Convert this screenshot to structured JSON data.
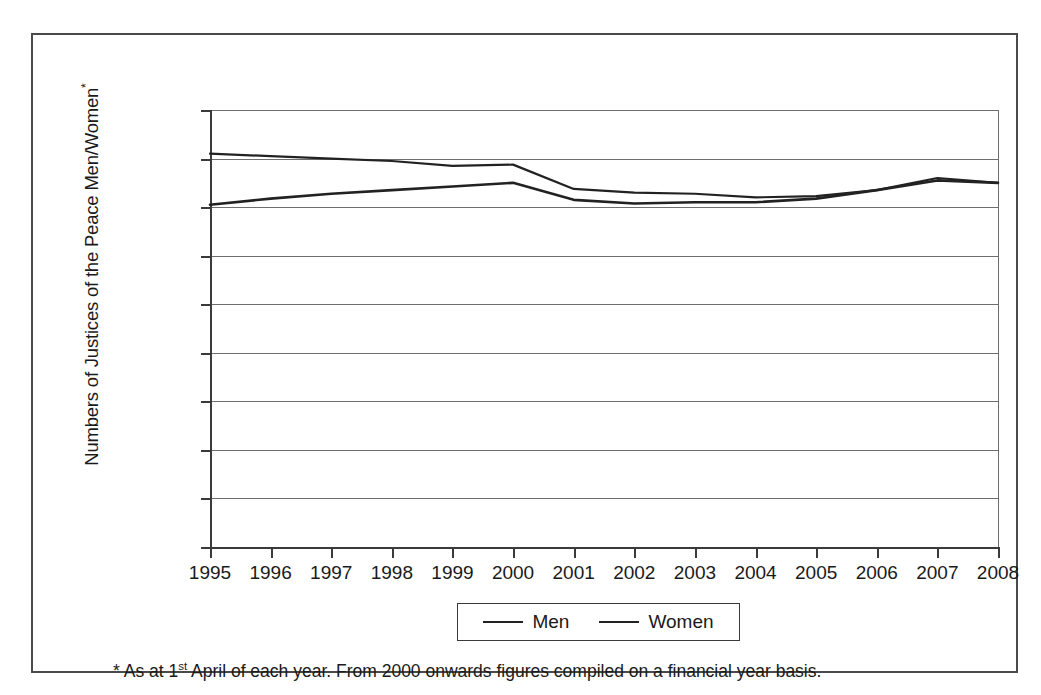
{
  "chart_data": {
    "type": "line",
    "title": "",
    "xlabel": "",
    "ylabel": "Numbers of Justices of the Peace Men/Women*",
    "ylabel_base": "Numbers of Justices of the Peace Men/Women",
    "ylabel_sup": "*",
    "x": [
      1995,
      1996,
      1997,
      1998,
      1999,
      2000,
      2001,
      2002,
      2003,
      2004,
      2005,
      2006,
      2007,
      2008
    ],
    "categories": [
      "1995",
      "1996",
      "1997",
      "1998",
      "1999",
      "2000",
      "2001",
      "2002",
      "2003",
      "2004",
      "2005",
      "2006",
      "2007",
      "2008"
    ],
    "series": [
      {
        "name": "Men",
        "color": "#222222",
        "values": [
          16200,
          16100,
          16000,
          15900,
          15700,
          15750,
          14750,
          14600,
          14550,
          14400,
          14450,
          14700,
          15200,
          15000
        ]
      },
      {
        "name": "Women",
        "color": "#222222",
        "values": [
          14100,
          14350,
          14550,
          14700,
          14850,
          15000,
          14300,
          14150,
          14200,
          14200,
          14350,
          14700,
          15100,
          15000
        ]
      }
    ],
    "ylim": [
      0,
      18000
    ],
    "yticks": [
      0,
      2000,
      4000,
      6000,
      8000,
      10000,
      12000,
      14000,
      16000,
      18000
    ],
    "ytick_labels": [
      "0",
      "2,000",
      "4,000",
      "6,000",
      "8,000",
      "10,000",
      "12,000",
      "14,000",
      "16,000",
      "18,000"
    ],
    "xlim": [
      1995,
      2008
    ],
    "grid": "horizontal",
    "legend_position": "bottom-center"
  },
  "legend": {
    "entries": [
      {
        "label": "Men"
      },
      {
        "label": "Women"
      }
    ]
  },
  "footnote": {
    "part1": "* As at 1",
    "sup": "st",
    "part2": " April of each year. From 2000 onwards figures compiled on a financial year basis."
  },
  "colors": {
    "frame": "#4a4a4a",
    "axis": "#3a3a3a",
    "gridline": "#6e6e6e",
    "line": "#222222",
    "text": "#1a1a1a",
    "background": "#ffffff"
  }
}
